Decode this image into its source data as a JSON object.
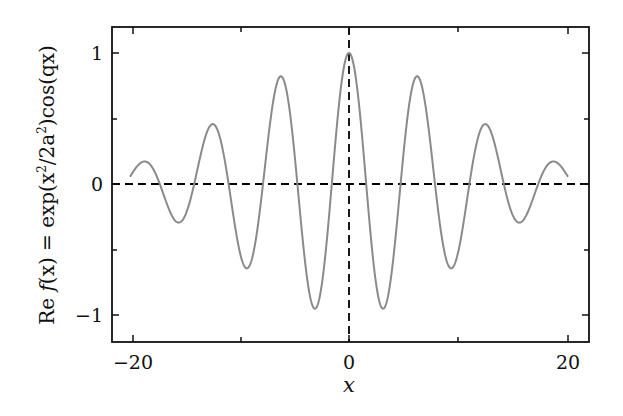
{
  "chart_data": {
    "type": "line",
    "title": "",
    "xlabel": "x",
    "ylabel": "Re f(x) = exp(x²/2a²)cos(qx)",
    "xlim": [
      -21.9,
      21.9
    ],
    "ylim": [
      -1.2,
      1.2
    ],
    "x_ticks": [
      -20,
      -10,
      0,
      10,
      20
    ],
    "x_tick_labels": [
      "−20",
      "",
      "0",
      "",
      "20"
    ],
    "y_ticks": [
      -1,
      -0.5,
      0,
      0.5,
      1
    ],
    "y_tick_labels": [
      "−1",
      "",
      "0",
      "",
      "1"
    ],
    "grid": false,
    "legend": null,
    "reference_lines": [
      {
        "orientation": "horizontal",
        "value": 0,
        "style": "dashed",
        "color": "#000000"
      },
      {
        "orientation": "vertical",
        "value": 0,
        "style": "dashed",
        "color": "#000000"
      }
    ],
    "series": [
      {
        "name": "Re f(x)",
        "color": "#8a8a8a",
        "function": "exp(-x^2/200)*cos(x)",
        "x_range": [
          -20,
          20
        ],
        "key_points": [
          {
            "x": -18.85,
            "y": 0.17
          },
          {
            "x": -15.71,
            "y": -0.29
          },
          {
            "x": -12.57,
            "y": 0.45
          },
          {
            "x": -9.42,
            "y": -0.64
          },
          {
            "x": -6.28,
            "y": 0.82
          },
          {
            "x": -3.14,
            "y": -0.95
          },
          {
            "x": 0,
            "y": 1.0
          },
          {
            "x": 3.14,
            "y": -0.95
          },
          {
            "x": 6.28,
            "y": 0.82
          },
          {
            "x": 9.42,
            "y": -0.64
          },
          {
            "x": 12.57,
            "y": 0.45
          },
          {
            "x": 15.71,
            "y": -0.29
          },
          {
            "x": 18.85,
            "y": 0.17
          },
          {
            "x": 20,
            "y": 0.055
          },
          {
            "x": -20,
            "y": 0.055
          }
        ]
      }
    ]
  },
  "labels": {
    "xlabel": "x",
    "ylabel_re": "Re",
    "ylabel_f": "f",
    "ylabel_x": "(x) = exp(x",
    "ylabel_sq1": "2",
    "ylabel_mid": "/2a",
    "ylabel_sq2": "2",
    "ylabel_end": ")cos(qx)",
    "xtick_m20": "−20",
    "xtick_0": "0",
    "xtick_20": "20",
    "ytick_1": "1",
    "ytick_0": "0",
    "ytick_m1": "−1"
  }
}
